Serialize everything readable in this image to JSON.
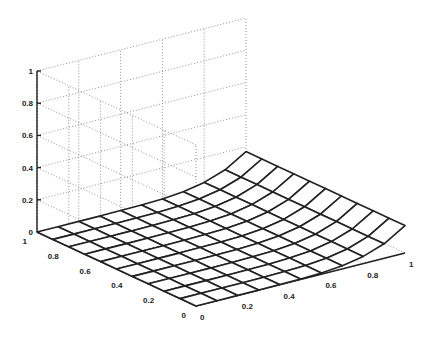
{
  "chart_data": {
    "type": "surface-mesh",
    "title": "",
    "xlabel": "",
    "ylabel": "",
    "zlabel": "",
    "grid": true,
    "x": {
      "range": [
        0,
        1
      ],
      "ticks": [
        0,
        0.2,
        0.4,
        0.6,
        0.8,
        1
      ],
      "tick_labels": [
        "0",
        "0.2",
        "0.4",
        "0.6",
        "0.8",
        "1"
      ]
    },
    "y": {
      "range": [
        0,
        1
      ],
      "ticks": [
        0,
        0.2,
        0.4,
        0.6,
        0.8,
        1
      ],
      "tick_labels": [
        "0",
        "0.2",
        "0.4",
        "0.6",
        "0.8",
        "1"
      ]
    },
    "z": {
      "range": [
        0,
        1
      ],
      "ticks": [
        0,
        0.2,
        0.4,
        0.6,
        0.8,
        1
      ],
      "tick_labels": [
        "0",
        "0.2",
        "0.4",
        "0.6",
        "0.8",
        "1"
      ]
    },
    "mesh_resolution": 11,
    "surface_description": "Flat near z=0 over most of the unit square, rising sharply along the edge x=1 to about z=0.17",
    "surface_profile_along_x": {
      "x": [
        0,
        0.1,
        0.2,
        0.3,
        0.4,
        0.5,
        0.6,
        0.7,
        0.8,
        0.9,
        1.0
      ],
      "z": [
        0,
        0,
        0,
        0,
        0.001,
        0.003,
        0.008,
        0.02,
        0.045,
        0.09,
        0.17
      ]
    },
    "projection": {
      "origin_front": [
        196,
        306
      ],
      "x_axis_end": [
        405,
        253
      ],
      "y_axis_end": [
        37,
        232
      ],
      "z_unit_px": 161
    }
  }
}
